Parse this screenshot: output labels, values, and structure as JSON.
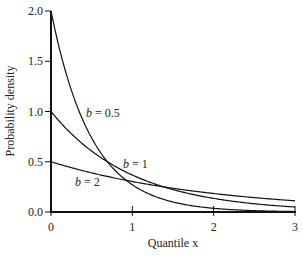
{
  "chart_data": {
    "type": "line",
    "title": "",
    "xlabel": "Quantile x",
    "ylabel": "Probability density",
    "xlim": [
      0,
      3
    ],
    "ylim": [
      0,
      2
    ],
    "xticks": [
      "0",
      "1",
      "2",
      "3"
    ],
    "yticks": [
      "0.0",
      "0.5",
      "1.0",
      "1.5",
      "2.0"
    ],
    "grid": false,
    "legend": "inline annotations",
    "function": "f(x) = (1/b) * exp(-x/b)",
    "series": [
      {
        "name": "b = 0.5",
        "b": 0.5,
        "x": [
          0,
          0.5,
          1,
          1.5,
          2,
          2.5,
          3
        ],
        "y": [
          2.0,
          0.736,
          0.271,
          0.1,
          0.037,
          0.013,
          0.005
        ]
      },
      {
        "name": "b = 1",
        "b": 1,
        "x": [
          0,
          0.5,
          1,
          1.5,
          2,
          2.5,
          3
        ],
        "y": [
          1.0,
          0.607,
          0.368,
          0.223,
          0.135,
          0.082,
          0.05
        ]
      },
      {
        "name": "b = 2",
        "b": 2,
        "x": [
          0,
          0.5,
          1,
          1.5,
          2,
          2.5,
          3
        ],
        "y": [
          0.5,
          0.389,
          0.303,
          0.236,
          0.184,
          0.143,
          0.112
        ]
      }
    ],
    "annotations": [
      {
        "text_prefix": "b",
        "text_suffix": " = 0.5"
      },
      {
        "text_prefix": "b",
        "text_suffix": " = 1"
      },
      {
        "text_prefix": "b",
        "text_suffix": " = 2"
      }
    ]
  }
}
